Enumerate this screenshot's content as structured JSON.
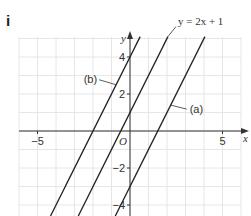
{
  "part_label": "i",
  "chart_data": {
    "type": "line",
    "title": "",
    "xlabel": "x",
    "ylabel": "y",
    "origin_label": "O",
    "xlim": [
      -6,
      6
    ],
    "ylim": [
      -4.6,
      5
    ],
    "grid": true,
    "x_ticks": [
      {
        "value": -5,
        "label": "−5"
      },
      {
        "value": 5,
        "label": "5"
      }
    ],
    "y_ticks": [
      {
        "value": 4,
        "label": "4"
      },
      {
        "value": 2,
        "label": "2"
      },
      {
        "value": -2,
        "label": "−2"
      },
      {
        "value": -4,
        "label": "−4"
      }
    ],
    "series": [
      {
        "name": "b",
        "label": "(b)",
        "slope": 2,
        "intercept": 4,
        "label_at_x": -0.75
      },
      {
        "name": "given",
        "label": "y = 2x + 1",
        "slope": 2,
        "intercept": 1,
        "label_at_x": 2
      },
      {
        "name": "a",
        "label": "(a)",
        "slope": 2,
        "intercept": -3,
        "label_at_x": 2.2
      }
    ],
    "line_color": "#222222"
  }
}
